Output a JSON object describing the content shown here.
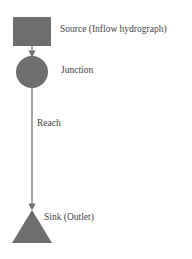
{
  "diagram": {
    "color": "#6e6e6e",
    "nodes": [
      {
        "id": "source",
        "shape": "square",
        "label": "Source (Inflow hydrograph)"
      },
      {
        "id": "junction",
        "shape": "circle",
        "label": "Junction"
      },
      {
        "id": "sink",
        "shape": "triangle",
        "label": "Sink (Outlet)"
      }
    ],
    "edges": [
      {
        "from": "source",
        "to": "junction",
        "label": ""
      },
      {
        "from": "junction",
        "to": "sink",
        "label": "Reach"
      }
    ]
  }
}
